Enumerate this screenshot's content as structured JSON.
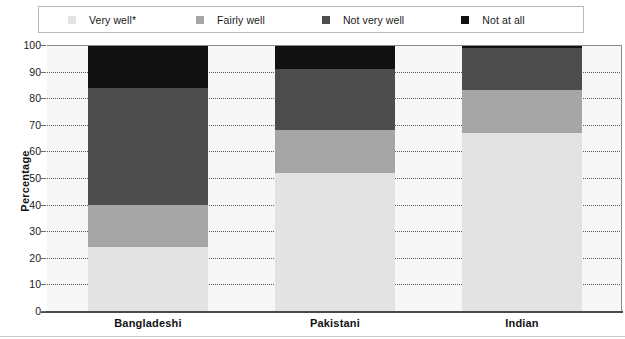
{
  "legend": {
    "items": [
      {
        "label": "Very well*",
        "color": "#e3e3e3",
        "icon": "square-swatch-icon"
      },
      {
        "label": "Fairly well",
        "color": "#a6a6a6",
        "icon": "square-swatch-icon"
      },
      {
        "label": "Not very well",
        "color": "#4d4d4d",
        "icon": "square-swatch-icon"
      },
      {
        "label": "Not at all",
        "color": "#111111",
        "icon": "square-swatch-icon"
      }
    ]
  },
  "axis": {
    "ylabel": "Percentage",
    "yticks": [
      "0",
      "10",
      "20",
      "30",
      "40",
      "50",
      "60",
      "70",
      "80",
      "90",
      "100"
    ],
    "categories": [
      "Bangladeshi",
      "Pakistani",
      "Indian"
    ]
  },
  "chart_data": {
    "type": "bar",
    "stacked": true,
    "stack_total": 100,
    "title": "",
    "xlabel": "",
    "ylabel": "Percentage",
    "ylim": [
      0,
      100
    ],
    "ytick_step": 10,
    "grid": true,
    "legend_position": "top",
    "categories": [
      "Bangladeshi",
      "Pakistani",
      "Indian"
    ],
    "series": [
      {
        "name": "Very well*",
        "color": "#e3e3e3",
        "values": [
          24,
          52,
          67
        ]
      },
      {
        "name": "Fairly well",
        "color": "#a6a6a6",
        "values": [
          16,
          16,
          16
        ]
      },
      {
        "name": "Not very well",
        "color": "#4d4d4d",
        "values": [
          44,
          23,
          16
        ]
      },
      {
        "name": "Not at all",
        "color": "#111111",
        "values": [
          16,
          9,
          1
        ]
      }
    ],
    "cumulative_tops": {
      "Bangladeshi": {
        "Very well*": 24,
        "Fairly well": 40,
        "Not very well": 84,
        "Not at all": 100
      },
      "Pakistani": {
        "Very well*": 52,
        "Fairly well": 68,
        "Not very well": 91,
        "Not at all": 100
      },
      "Indian": {
        "Very well*": 67,
        "Fairly well": 83,
        "Not very well": 99,
        "Not at all": 100
      }
    }
  }
}
